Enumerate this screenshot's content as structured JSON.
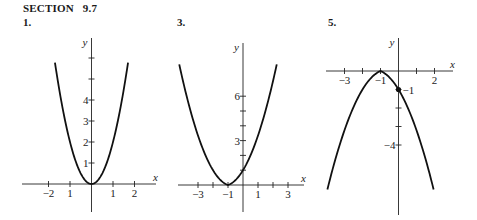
{
  "header": {
    "section": "SECTION   9.7"
  },
  "chart_data": [
    {
      "type": "line",
      "problem": "1.",
      "title": "",
      "xlabel": "x",
      "ylabel": "y",
      "function": "y = 2x^2",
      "origin_px": [
        91.5,
        184
      ],
      "unit_px": [
        21.5,
        21
      ],
      "x_axis_px": [
        22,
        156
      ],
      "y_axis_px": [
        38,
        212
      ],
      "x_ticks": [
        -2,
        -1,
        1,
        2
      ],
      "x_tick_labels": [
        {
          "v": -2,
          "t": "−2"
        },
        {
          "v": -1,
          "t": "1"
        },
        {
          "v": 1,
          "t": "1"
        },
        {
          "v": 2,
          "t": "2"
        }
      ],
      "y_ticks": [
        1,
        2,
        3,
        4,
        5,
        6
      ],
      "y_tick_labels": [
        {
          "v": 1,
          "t": "1"
        },
        {
          "v": 2,
          "t": "2"
        },
        {
          "v": 3,
          "t": "3"
        },
        {
          "v": 4,
          "t": "4"
        }
      ],
      "curve": {
        "kind": "quad",
        "h": 0,
        "k": 0,
        "a": 2,
        "b": 0,
        "sign": 1,
        "xrange": [
          -1.7,
          1.7
        ]
      },
      "points": [
        {
          "x": -1.7,
          "y": 5.8
        },
        {
          "x": 0,
          "y": 0
        },
        {
          "x": 1.7,
          "y": 5.8
        }
      ],
      "ylim": [
        -1.3,
        7
      ],
      "xlim": [
        -3.2,
        3
      ]
    },
    {
      "type": "line",
      "problem": "3.",
      "title": "",
      "xlabel": "x",
      "ylabel": "y",
      "function": "vertex (-1, 0), y-intercept 1",
      "origin_px": [
        243,
        185
      ],
      "unit_px": [
        15,
        14.8
      ],
      "x_axis_px": [
        178,
        304
      ],
      "y_axis_px": [
        43,
        212
      ],
      "x_ticks": [
        -3,
        -2,
        -1,
        1,
        2,
        3
      ],
      "x_tick_labels": [
        {
          "v": -3,
          "t": "−3"
        },
        {
          "v": -1,
          "t": "−1"
        },
        {
          "v": 1,
          "t": "1"
        },
        {
          "v": 3,
          "t": "3"
        }
      ],
      "y_ticks": [
        1,
        2,
        3,
        4,
        5,
        6
      ],
      "y_tick_labels": [
        {
          "v": 3,
          "t": "3"
        },
        {
          "v": 6,
          "t": "6"
        }
      ],
      "curve": {
        "kind": "quad",
        "h": -1,
        "k": 0,
        "a": 0.67,
        "b": 0.33,
        "sign": 1,
        "xrange": [
          -4.25,
          2.25
        ]
      },
      "points": [
        {
          "x": -4.25,
          "y": 8
        },
        {
          "x": -1,
          "y": 0
        },
        {
          "x": 0,
          "y": 1
        },
        {
          "x": 2.25,
          "y": 8
        }
      ],
      "ylim": [
        -1.8,
        9.6
      ],
      "xlim": [
        -4.3,
        4.1
      ]
    },
    {
      "type": "line",
      "problem": "5.",
      "title": "",
      "xlabel": "x",
      "ylabel": "y",
      "function": "vertex (-1, 0), passes (0, -1)",
      "origin_px": [
        398.5,
        71
      ],
      "unit_px": [
        18,
        18.5
      ],
      "x_axis_px": [
        326,
        453
      ],
      "y_axis_px": [
        38,
        215
      ],
      "x_ticks": [
        -3,
        -2,
        -1,
        1,
        2
      ],
      "x_tick_labels": [
        {
          "v": -3,
          "t": "−3"
        },
        {
          "v": -1,
          "t": "−1"
        },
        {
          "v": 2,
          "t": "2"
        }
      ],
      "y_ticks": [
        -1,
        -2,
        -3,
        -4
      ],
      "y_tick_labels": [
        {
          "v": -1,
          "t": "−1",
          "side": "right"
        },
        {
          "v": -4,
          "t": "−4",
          "side": "left"
        }
      ],
      "curve": {
        "kind": "quad",
        "h": -1,
        "k": 0,
        "a": 0.6,
        "b": 0.4,
        "sign": -1,
        "xrange": [
          -3.95,
          1.95
        ]
      },
      "points": [
        {
          "x": -3.95,
          "y": -6.6
        },
        {
          "x": -1,
          "y": 0
        },
        {
          "x": 0,
          "y": -1,
          "marked": true
        },
        {
          "x": 1.95,
          "y": -6.6
        }
      ],
      "ylim": [
        -7.8,
        1.8
      ],
      "xlim": [
        -4,
        3
      ]
    }
  ]
}
